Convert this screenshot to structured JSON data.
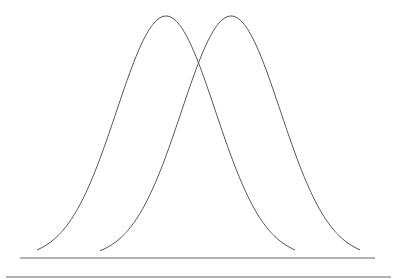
{
  "diagram": {
    "type": "overlapping-normal-distributions",
    "stroke_color": "#555555",
    "baseline_color": "#666666",
    "curves": [
      {
        "name": "left-distribution",
        "center_x": 166,
        "sigma": 49.5,
        "x_start": 37,
        "x_end": 295
      },
      {
        "name": "right-distribution",
        "center_x": 231,
        "sigma": 49.5,
        "x_start": 100,
        "x_end": 360
      }
    ],
    "peak_y": 16,
    "axis_y": 258,
    "axis_line": {
      "x1": 20,
      "x2": 375,
      "y": 258
    },
    "lower_line": {
      "x1": 6,
      "x2": 391,
      "y": 277
    }
  }
}
